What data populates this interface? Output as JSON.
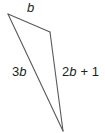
{
  "figure": {
    "type": "triangle-diagram",
    "background_color": "#ffffff",
    "stroke_color": "#58595b",
    "stroke_width": 1,
    "text_color": "#231f20",
    "vertices": [
      {
        "name": "top-left-vertex",
        "x": 8,
        "y": 14
      },
      {
        "name": "top-right-vertex",
        "x": 50,
        "y": 32
      },
      {
        "name": "bottom-vertex",
        "x": 63,
        "y": 131
      }
    ],
    "sides": [
      {
        "name": "top-side",
        "label": "b",
        "label_parts": [
          {
            "text": "b",
            "style": "var"
          }
        ],
        "from": "top-left-vertex",
        "to": "top-right-vertex"
      },
      {
        "name": "left-side",
        "label": "3b",
        "label_parts": [
          {
            "text": "3",
            "style": "num"
          },
          {
            "text": "b",
            "style": "var"
          }
        ],
        "from": "top-left-vertex",
        "to": "bottom-vertex"
      },
      {
        "name": "right-side",
        "label": "2b + 1",
        "label_parts": [
          {
            "text": "2",
            "style": "num"
          },
          {
            "text": "b",
            "style": "var"
          },
          {
            "text": " + 1",
            "style": "op"
          }
        ],
        "from": "top-right-vertex",
        "to": "bottom-vertex"
      }
    ]
  }
}
